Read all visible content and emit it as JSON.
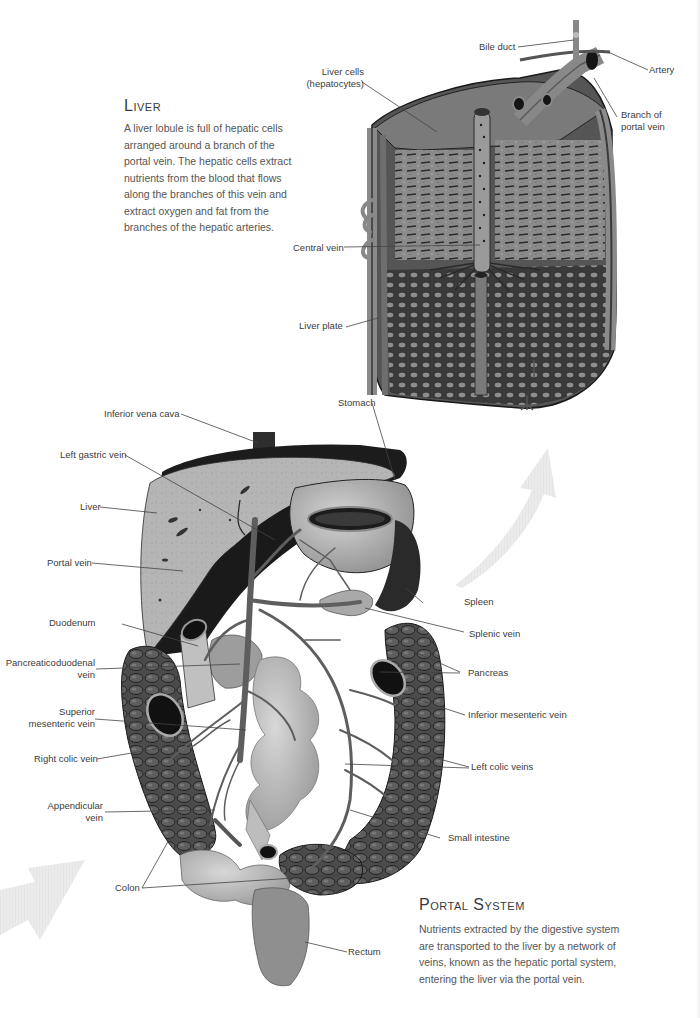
{
  "liver_section": {
    "title": "Liver",
    "body": "A liver lobule is full of hepatic cells arranged around a branch of the portal vein. The hepatic cells extract nutrients from the blood that flows along the branches of this vein and extract oxygen and fat from the branches of the hepatic arteries."
  },
  "portal_section": {
    "title": "Portal System",
    "body": "Nutrients extracted by the digestive system are transported to the liver by a network of veins, known as the hepatic portal system, entering the liver via the portal vein."
  },
  "lobule_labels": {
    "bile_duct": "Bile duct",
    "artery": "Artery",
    "liver_cells_1": "Liver cells",
    "liver_cells_2": "(hepatocytes)",
    "branch_portal_1": "Branch of",
    "branch_portal_2": "portal vein",
    "central_vein": "Central vein",
    "liver_plate": "Liver plate"
  },
  "portal_labels": {
    "inferior_vena_cava": "Inferior vena cava",
    "stomach": "Stomach",
    "left_gastric_vein": "Left gastric vein",
    "liver": "Liver",
    "portal_vein": "Portal vein",
    "spleen": "Spleen",
    "duodenum": "Duodenum",
    "splenic_vein": "Splenic vein",
    "pancreaticoduodenal_1": "Pancreaticoduodenal",
    "pancreaticoduodenal_2": "vein",
    "pancreas": "Pancreas",
    "superior_mesenteric_1": "Superior",
    "superior_mesenteric_2": "mesenteric vein",
    "inferior_mesenteric_vein": "Inferior mesenteric vein",
    "right_colic_vein": "Right colic vein",
    "left_colic_veins": "Left colic veins",
    "appendicular_1": "Appendicular",
    "appendicular_2": "vein",
    "small_intestine": "Small intestine",
    "colon": "Colon",
    "rectum": "Rectum"
  },
  "colors": {
    "liver_tissue": "#b8b8b8",
    "dark_shade": "#1e1e1e",
    "vein": "#6a6a6a",
    "arrow": "#e8e8e8"
  }
}
